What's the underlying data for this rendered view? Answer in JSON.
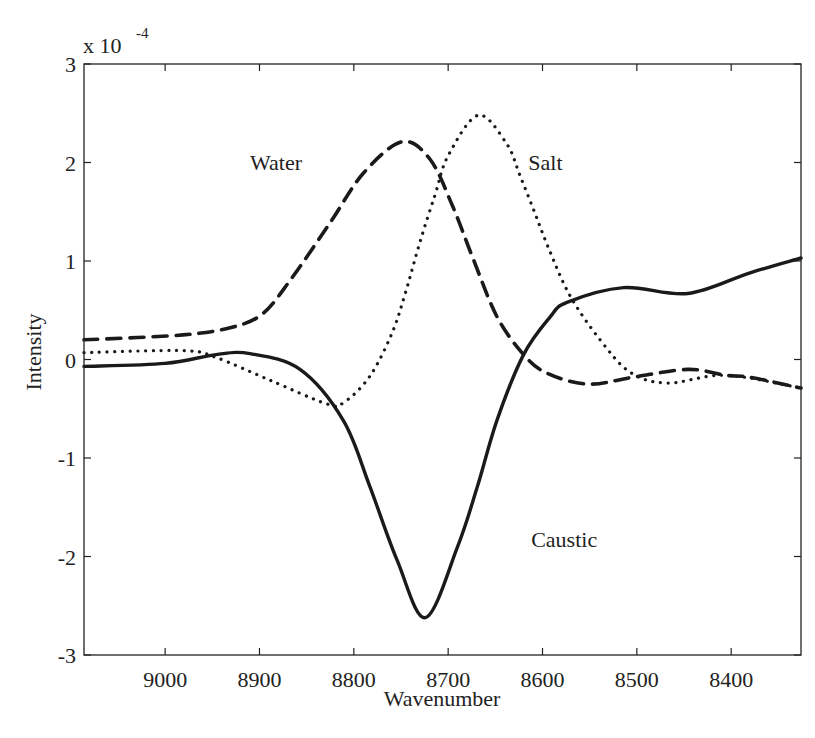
{
  "chart_data": {
    "type": "line",
    "title": "",
    "xlabel": "Wavenumber",
    "ylabel": "Intensity",
    "y_multiplier_label": "x 10",
    "y_multiplier_exponent": "-4",
    "xlim": [
      9086,
      8326
    ],
    "x_reversed": true,
    "ylim": [
      -3,
      3
    ],
    "grid": false,
    "legend": "none (inline labels)",
    "x_ticks": [
      9000,
      8900,
      8800,
      8700,
      8600,
      8500,
      8400
    ],
    "x_tick_labels": [
      "9000",
      "8900",
      "8800",
      "8700",
      "8600",
      "8500",
      "8400"
    ],
    "y_ticks": [
      -3,
      -2,
      -1,
      0,
      1,
      2,
      3
    ],
    "y_tick_labels": [
      "-3",
      "-2",
      "-1",
      "0",
      "1",
      "2",
      "3"
    ],
    "series": [
      {
        "name": "Caustic",
        "style": "solid",
        "label_pos": [
          8612,
          -1.9
        ],
        "x": [
          9086,
          9000,
          8946,
          8910,
          8857,
          8811,
          8783,
          8754,
          8724,
          8690,
          8669,
          8648,
          8620,
          8592,
          8574,
          8514,
          8446,
          8380,
          8326
        ],
        "values": [
          -0.07,
          -0.04,
          0.05,
          0.06,
          -0.1,
          -0.62,
          -1.29,
          -2.04,
          -2.62,
          -1.9,
          -1.29,
          -0.61,
          0.05,
          0.43,
          0.58,
          0.73,
          0.67,
          0.88,
          1.03
        ]
      },
      {
        "name": "Water",
        "style": "dashed",
        "label_pos": [
          8910,
          1.92
        ],
        "x": [
          9086,
          8981,
          8928,
          8896,
          8867,
          8825,
          8790,
          8749,
          8719,
          8695,
          8673,
          8648,
          8620,
          8595,
          8552,
          8504,
          8446,
          8406,
          8380,
          8326
        ],
        "values": [
          0.2,
          0.25,
          0.33,
          0.47,
          0.81,
          1.39,
          1.89,
          2.21,
          2.03,
          1.55,
          1.01,
          0.43,
          0.05,
          -0.14,
          -0.25,
          -0.18,
          -0.1,
          -0.16,
          -0.18,
          -0.29
        ]
      },
      {
        "name": "Salt",
        "style": "dotted",
        "label_pos": [
          8615,
          1.92
        ],
        "x": [
          9086,
          8981,
          8946,
          8889,
          8829,
          8811,
          8783,
          8759,
          8744,
          8730,
          8714,
          8700,
          8668,
          8638,
          8624,
          8609,
          8594,
          8571,
          8539,
          8507,
          8468,
          8406,
          8326
        ],
        "values": [
          0.07,
          0.09,
          0.02,
          -0.21,
          -0.45,
          -0.44,
          -0.17,
          0.28,
          0.72,
          1.19,
          1.67,
          2.07,
          2.48,
          2.19,
          1.87,
          1.51,
          1.14,
          0.65,
          0.2,
          -0.13,
          -0.24,
          -0.16,
          -0.29
        ]
      }
    ]
  },
  "colors": {
    "line": "#1a1a1a",
    "axis": "#222222",
    "background": "#ffffff"
  }
}
